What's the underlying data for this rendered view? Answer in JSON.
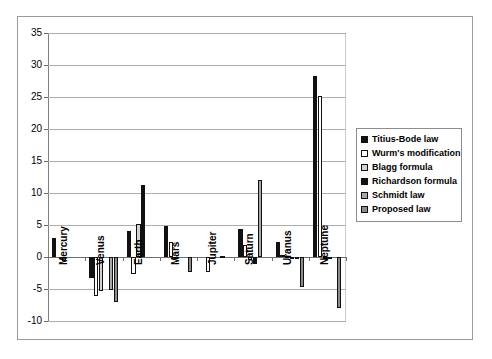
{
  "chart_data": {
    "type": "bar",
    "title": "",
    "xlabel": "",
    "ylabel": "",
    "ylim": [
      -10,
      35
    ],
    "ytick_step": 5,
    "yticks": [
      35,
      30,
      25,
      20,
      15,
      10,
      5,
      0,
      -5,
      -10
    ],
    "ytick_labels": [
      "35",
      "30",
      "25",
      "20",
      "15",
      "10",
      "5",
      "0",
      "-5",
      "-10"
    ],
    "grid": true,
    "legend_position": "right",
    "categories": [
      "Mercury",
      "Venus",
      "Earth",
      "Mars",
      "Jupiter",
      "Saturn",
      "Uranus",
      "Neptune"
    ],
    "series": [
      {
        "name": "Titius-Bode law",
        "color": "#111111",
        "values": [
          3.0,
          -3.3,
          4.0,
          4.9,
          0.0,
          4.3,
          2.3,
          28.3
        ]
      },
      {
        "name": "Wurm's modification",
        "color": "#ffffff",
        "values": [
          0.0,
          -6.1,
          -2.6,
          2.3,
          -2.4,
          1.8,
          0.3,
          25.2
        ]
      },
      {
        "name": "Blagg formula",
        "color": "#d3d3d3",
        "values": [
          -0.6,
          -5.3,
          5.1,
          -0.2,
          0.0,
          -0.4,
          0.2,
          -0.2
        ]
      },
      {
        "name": "Richardson formula",
        "color": "#111111",
        "values": [
          0.0,
          0.0,
          11.2,
          0.0,
          0.0,
          -1.1,
          -0.2,
          -0.3
        ]
      },
      {
        "name": "Schmidt law",
        "color": "#a8a8a8",
        "values": [
          0.0,
          -5.2,
          0.0,
          0.0,
          0.2,
          12.1,
          -0.2,
          0.0
        ]
      },
      {
        "name": "Proposed law",
        "color": "#8c8c8c",
        "values": [
          0.0,
          -7.1,
          0.0,
          -2.4,
          0.0,
          0.0,
          -4.7,
          -8.0
        ]
      }
    ]
  }
}
